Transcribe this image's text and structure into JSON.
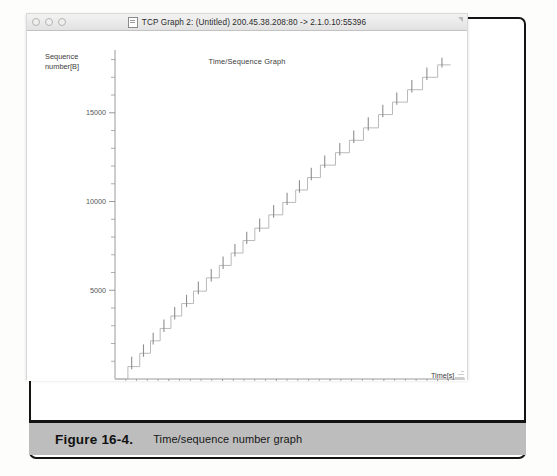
{
  "window": {
    "title": "TCP Graph 2: (Untitled) 200.45.38.208:80 -> 2.1.0.10:55396",
    "icon": "document-icon",
    "controls": [
      "close-button",
      "minimize-button",
      "zoom-button"
    ]
  },
  "figure": {
    "number": "Figure 16-4.",
    "caption": "Time/sequence number graph"
  },
  "chart_data": {
    "type": "line",
    "title": "Time/Sequence Graph",
    "xlabel": "Time[s]",
    "ylabel": "Sequence number[B]",
    "xlim": [
      0.0,
      3.18
    ],
    "ylim": [
      0,
      18200
    ],
    "xticks": [
      0.5,
      1.0,
      1.5,
      2.0,
      2.5,
      3.0
    ],
    "xtick_labels": [
      "0.5",
      "1.0",
      "1.5",
      "2.0",
      "2.5",
      "3.0"
    ],
    "x_minor_tick_step": 0.1,
    "yticks": [
      5000,
      10000,
      15000
    ],
    "ytick_labels": [
      "5000",
      "10000",
      "15000"
    ],
    "y_minor_tick_step": 1000,
    "grid": false,
    "legend": null,
    "series": [
      {
        "name": "sequence-number-staircase",
        "style": "step-post",
        "color": "#b9b9b9",
        "points": [
          [
            0.0,
            0
          ],
          [
            0.12,
            0
          ],
          [
            0.12,
            700
          ],
          [
            0.23,
            700
          ],
          [
            0.23,
            1450
          ],
          [
            0.33,
            1450
          ],
          [
            0.33,
            2150
          ],
          [
            0.42,
            2150
          ],
          [
            0.42,
            2850
          ],
          [
            0.52,
            2850
          ],
          [
            0.52,
            3550
          ],
          [
            0.62,
            3550
          ],
          [
            0.62,
            4250
          ],
          [
            0.73,
            4250
          ],
          [
            0.73,
            4950
          ],
          [
            0.85,
            4950
          ],
          [
            0.85,
            5700
          ],
          [
            0.97,
            5700
          ],
          [
            0.97,
            6400
          ],
          [
            1.08,
            6400
          ],
          [
            1.08,
            7100
          ],
          [
            1.19,
            7100
          ],
          [
            1.19,
            7800
          ],
          [
            1.3,
            7800
          ],
          [
            1.3,
            8500
          ],
          [
            1.43,
            8500
          ],
          [
            1.43,
            9250
          ],
          [
            1.56,
            9250
          ],
          [
            1.56,
            9950
          ],
          [
            1.68,
            9950
          ],
          [
            1.68,
            10650
          ],
          [
            1.79,
            10650
          ],
          [
            1.79,
            11350
          ],
          [
            1.91,
            11350
          ],
          [
            1.91,
            12050
          ],
          [
            2.05,
            12050
          ],
          [
            2.05,
            12750
          ],
          [
            2.18,
            12750
          ],
          [
            2.18,
            13450
          ],
          [
            2.31,
            13450
          ],
          [
            2.31,
            14150
          ],
          [
            2.45,
            14150
          ],
          [
            2.45,
            14900
          ],
          [
            2.58,
            14900
          ],
          [
            2.58,
            15600
          ],
          [
            2.72,
            15600
          ],
          [
            2.72,
            16300
          ],
          [
            2.86,
            16300
          ],
          [
            2.86,
            17000
          ],
          [
            3.0,
            17000
          ],
          [
            3.0,
            17700
          ],
          [
            3.12,
            17700
          ]
        ]
      },
      {
        "name": "ack-segment-bars",
        "style": "vertical-ticks",
        "color": "#8e8e8e",
        "bars": [
          [
            0.155,
            550,
            1250
          ],
          [
            0.265,
            1250,
            1950
          ],
          [
            0.355,
            1950,
            2600
          ],
          [
            0.455,
            2650,
            3350
          ],
          [
            0.555,
            3350,
            4050
          ],
          [
            0.665,
            4050,
            4750
          ],
          [
            0.775,
            4780,
            5500
          ],
          [
            0.895,
            5500,
            6200
          ],
          [
            1.005,
            6200,
            6900
          ],
          [
            1.115,
            6900,
            7600
          ],
          [
            1.225,
            7600,
            8300
          ],
          [
            1.345,
            8300,
            9050
          ],
          [
            1.475,
            9080,
            9800
          ],
          [
            1.6,
            9800,
            10500
          ],
          [
            1.715,
            10500,
            11200
          ],
          [
            1.825,
            11200,
            11900
          ],
          [
            1.95,
            11900,
            12600
          ],
          [
            2.09,
            12600,
            13300
          ],
          [
            2.22,
            13300,
            14000
          ],
          [
            2.355,
            14000,
            14750
          ],
          [
            2.49,
            14750,
            15450
          ],
          [
            2.62,
            15450,
            16150
          ],
          [
            2.76,
            16150,
            16850
          ],
          [
            2.9,
            16850,
            17550
          ],
          [
            3.04,
            17550,
            18100
          ]
        ]
      }
    ]
  }
}
